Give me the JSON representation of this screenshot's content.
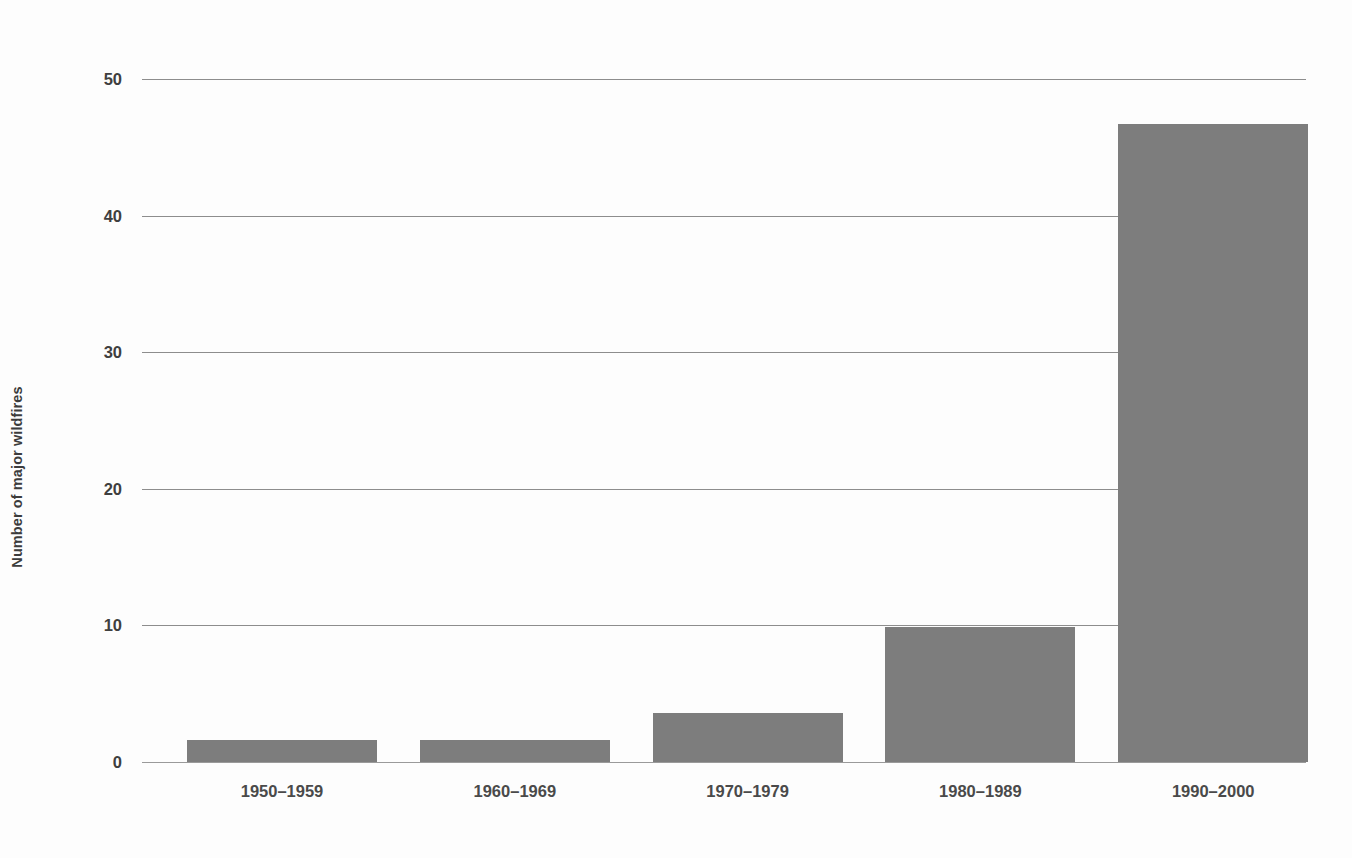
{
  "chart_data": {
    "type": "bar",
    "title": "",
    "subtitle": "",
    "xlabel": "",
    "ylabel": "Number of major wildfires",
    "categories": [
      "1950–1959",
      "1960–1969",
      "1970–1979",
      "1980–1989",
      "1990–2000"
    ],
    "values": [
      1.6,
      1.6,
      3.6,
      9.9,
      46.7
    ],
    "ylim": [
      0,
      50
    ],
    "yticks": [
      0,
      10,
      20,
      30,
      40,
      50
    ],
    "ytick_labels": [
      "0",
      "10",
      "20",
      "30",
      "40",
      "50"
    ],
    "grid": true,
    "grid_axis": "y",
    "legend": false,
    "legend_position": "none",
    "bar_color": "#7d7d7d",
    "grid_color": "#8d8d8d",
    "axis_text_color": "#3f3f3f",
    "background_color": "#fdfdfd"
  },
  "axes": {
    "y_title": "Number of major wildfires",
    "y_ticks": [
      {
        "value": 50,
        "label": "50"
      },
      {
        "value": 40,
        "label": "40"
      },
      {
        "value": 30,
        "label": "30"
      },
      {
        "value": 20,
        "label": "20"
      },
      {
        "value": 10,
        "label": "10"
      },
      {
        "value": 0,
        "label": "0"
      }
    ],
    "x_ticks": [
      {
        "label": "1950–1959"
      },
      {
        "label": "1960–1969"
      },
      {
        "label": "1970–1979"
      },
      {
        "label": "1980–1989"
      },
      {
        "label": "1990–2000"
      }
    ]
  }
}
